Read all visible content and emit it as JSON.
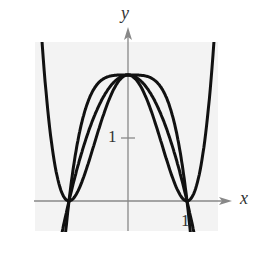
{
  "chart_data": {
    "type": "line",
    "title": "",
    "xlabel": "x",
    "ylabel": "y",
    "x_ticks": [
      {
        "value": 1,
        "label": "1"
      }
    ],
    "y_ticks": [
      {
        "value": 1,
        "label": "1"
      }
    ],
    "xlim": [
      -1.6,
      1.55
    ],
    "ylim": [
      -0.5,
      2.6
    ],
    "grid": false,
    "legend": null,
    "series": [
      {
        "name": "quartic",
        "formula": "2(x^2-1)^2",
        "x": [
          -1.55,
          -1.4,
          -1.2,
          -1,
          -0.5,
          0,
          0.5,
          1,
          1.2,
          1.4,
          1.55
        ],
        "y": [
          3.0,
          1.93,
          0.39,
          0,
          1.13,
          2,
          1.13,
          0,
          0.39,
          1.93,
          3.0
        ]
      },
      {
        "name": "parabola",
        "formula": "2-2x^2",
        "x": [
          -1.2,
          -1,
          -0.5,
          0,
          0.5,
          1,
          1.2
        ],
        "y": [
          -0.88,
          0,
          1.5,
          2,
          1.5,
          0,
          -0.88
        ]
      },
      {
        "name": "quartic_arch",
        "formula": "2-2x^4",
        "x": [
          -1.1,
          -1,
          -0.5,
          0,
          0.5,
          1,
          1.1
        ],
        "y": [
          -0.93,
          0,
          1.88,
          2,
          1.88,
          0,
          -0.93
        ]
      }
    ],
    "points_of_intersection": [
      [
        -1,
        0
      ],
      [
        1,
        0
      ]
    ]
  },
  "labels": {
    "x_axis": "x",
    "y_axis": "y",
    "x_tick_1": "1",
    "y_tick_1": "1"
  }
}
